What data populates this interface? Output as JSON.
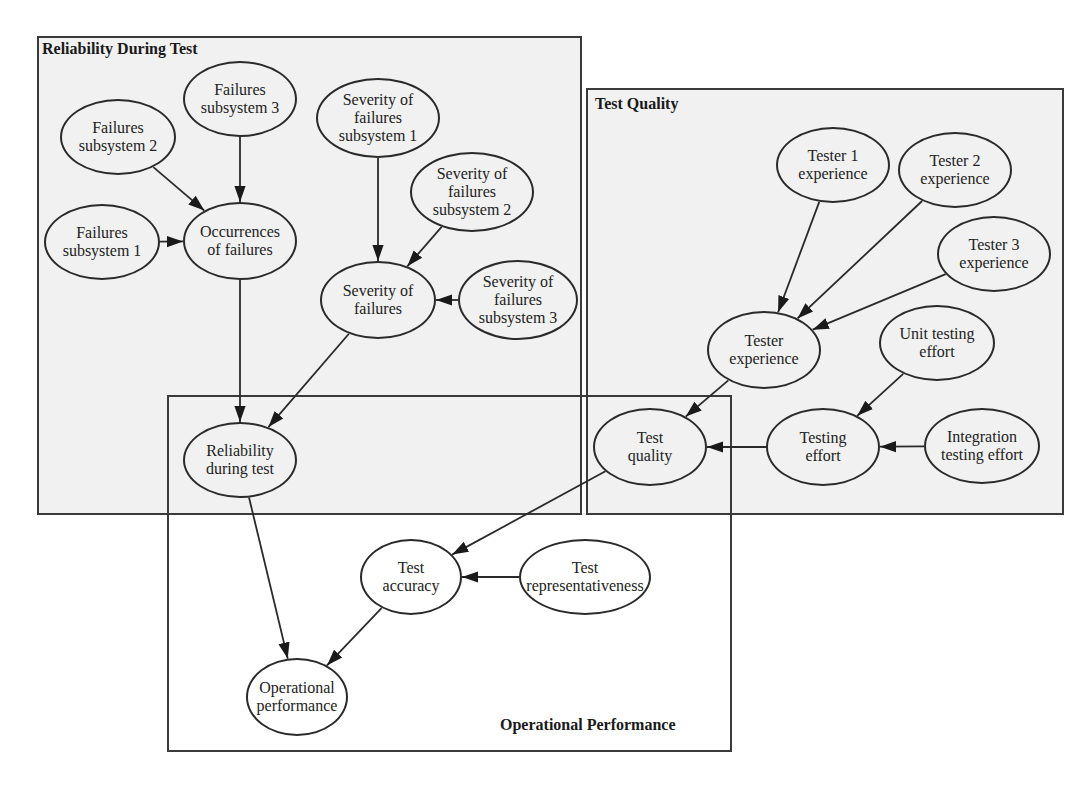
{
  "diagram": {
    "groups": [
      {
        "id": "reliability",
        "label": "Reliability During Test",
        "x": 37,
        "y": 36,
        "w": 545,
        "h": 479,
        "label_x": 42,
        "label_y": 40
      },
      {
        "id": "quality",
        "label": "Test Quality",
        "x": 586,
        "y": 88,
        "w": 478,
        "h": 427,
        "label_x": 595,
        "label_y": 95
      },
      {
        "id": "operational",
        "label": "Operational Performance",
        "x": 167,
        "y": 395,
        "w": 565,
        "h": 357,
        "label_x": 500,
        "label_y": 716
      }
    ],
    "nodes": [
      {
        "id": "fs3",
        "lines": [
          "Failures",
          "subsystem 3"
        ],
        "cx": 240,
        "cy": 99,
        "rx": 57,
        "ry": 38
      },
      {
        "id": "fs2",
        "lines": [
          "Failures",
          "subsystem 2"
        ],
        "cx": 118,
        "cy": 137,
        "rx": 58,
        "ry": 38
      },
      {
        "id": "fs1",
        "lines": [
          "Failures",
          "subsystem 1"
        ],
        "cx": 102,
        "cy": 242,
        "rx": 58,
        "ry": 38
      },
      {
        "id": "occ",
        "lines": [
          "Occurrences",
          "of failures"
        ],
        "cx": 240,
        "cy": 241,
        "rx": 57,
        "ry": 39
      },
      {
        "id": "sfs1",
        "lines": [
          "Severity of",
          "failures",
          "subsystem 1"
        ],
        "cx": 378,
        "cy": 118,
        "rx": 62,
        "ry": 40
      },
      {
        "id": "sfs2",
        "lines": [
          "Severity of",
          "failures",
          "subsystem 2"
        ],
        "cx": 472,
        "cy": 192,
        "rx": 62,
        "ry": 40
      },
      {
        "id": "sev",
        "lines": [
          "Severity of",
          "failures"
        ],
        "cx": 378,
        "cy": 300,
        "rx": 58,
        "ry": 39
      },
      {
        "id": "sfs3",
        "lines": [
          "Severity of",
          "failures",
          "subsystem 3"
        ],
        "cx": 518,
        "cy": 300,
        "rx": 60,
        "ry": 40
      },
      {
        "id": "rdt",
        "lines": [
          "Reliability",
          "during test"
        ],
        "cx": 240,
        "cy": 460,
        "rx": 57,
        "ry": 38
      },
      {
        "id": "t1",
        "lines": [
          "Tester 1",
          "experience"
        ],
        "cx": 833,
        "cy": 165,
        "rx": 57,
        "ry": 38
      },
      {
        "id": "t2",
        "lines": [
          "Tester 2",
          "experience"
        ],
        "cx": 955,
        "cy": 170,
        "rx": 57,
        "ry": 38
      },
      {
        "id": "t3",
        "lines": [
          "Tester 3",
          "experience"
        ],
        "cx": 994,
        "cy": 254,
        "rx": 57,
        "ry": 38
      },
      {
        "id": "texp",
        "lines": [
          "Tester",
          "experience"
        ],
        "cx": 764,
        "cy": 350,
        "rx": 57,
        "ry": 39
      },
      {
        "id": "ute",
        "lines": [
          "Unit testing",
          "effort"
        ],
        "cx": 937,
        "cy": 343,
        "rx": 58,
        "ry": 38
      },
      {
        "id": "tq",
        "lines": [
          "Test",
          "quality"
        ],
        "cx": 650,
        "cy": 447,
        "rx": 57,
        "ry": 39
      },
      {
        "id": "te",
        "lines": [
          "Testing",
          "effort"
        ],
        "cx": 823,
        "cy": 447,
        "rx": 57,
        "ry": 39
      },
      {
        "id": "ite",
        "lines": [
          "Integration",
          "testing effort"
        ],
        "cx": 982,
        "cy": 446,
        "rx": 58,
        "ry": 38
      },
      {
        "id": "tacc",
        "lines": [
          "Test",
          "accuracy"
        ],
        "cx": 411,
        "cy": 577,
        "rx": 51,
        "ry": 38,
        "white": true
      },
      {
        "id": "trep",
        "lines": [
          "Test",
          "representativeness"
        ],
        "cx": 585,
        "cy": 577,
        "rx": 66,
        "ry": 38,
        "white": true
      },
      {
        "id": "op",
        "lines": [
          "Operational",
          "performance"
        ],
        "cx": 297,
        "cy": 697,
        "rx": 51,
        "ry": 39,
        "white": true
      }
    ],
    "edges": [
      [
        "fs3",
        "occ"
      ],
      [
        "fs2",
        "occ"
      ],
      [
        "fs1",
        "occ"
      ],
      [
        "sfs1",
        "sev"
      ],
      [
        "sfs2",
        "sev"
      ],
      [
        "sfs3",
        "sev"
      ],
      [
        "occ",
        "rdt"
      ],
      [
        "sev",
        "rdt"
      ],
      [
        "t1",
        "texp"
      ],
      [
        "t2",
        "texp"
      ],
      [
        "t3",
        "texp"
      ],
      [
        "texp",
        "tq"
      ],
      [
        "ute",
        "te"
      ],
      [
        "ite",
        "te"
      ],
      [
        "te",
        "tq"
      ],
      [
        "tq",
        "tacc"
      ],
      [
        "trep",
        "tacc"
      ],
      [
        "rdt",
        "op"
      ],
      [
        "tacc",
        "op"
      ]
    ],
    "colors": {
      "line": "#2a2a2a",
      "shade": "#f1f1f1",
      "border": "#3a3a3a"
    }
  }
}
